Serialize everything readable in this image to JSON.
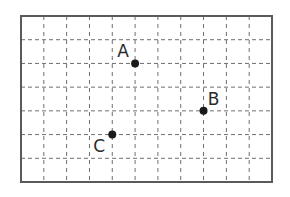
{
  "diagram": {
    "type": "coordinate-grid",
    "columns": 11,
    "rows": 7,
    "colors": {
      "border": "#5a5a5a",
      "gridline": "#6e6e6e",
      "point": "#1a1a1a",
      "label": "#2a2a2a",
      "background": "#ffffff"
    },
    "points": [
      {
        "label": "A",
        "col": 5,
        "row": 5
      },
      {
        "label": "B",
        "col": 8,
        "row": 3
      },
      {
        "label": "C",
        "col": 4,
        "row": 2
      }
    ]
  }
}
